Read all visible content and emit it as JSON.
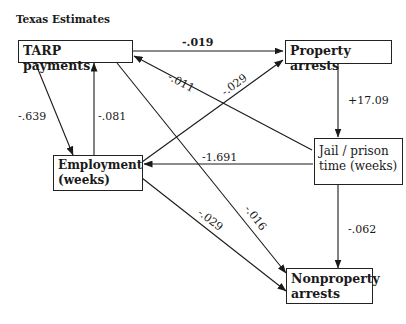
{
  "title": "Texas Estimates",
  "nodes": {
    "tarp": "TARP payments",
    "property": "Property arrests",
    "employment_l1": "Employment",
    "employment_l2": "(weeks)",
    "jail_l1": "Jail / prison",
    "jail_l2": "time (weeks)",
    "nonproperty_l1": "Nonproperty",
    "nonproperty_l2": "arrests"
  },
  "edges": [
    {
      "from": "TARP payments",
      "to": "Property arrests",
      "label": "-.019"
    },
    {
      "from": "TARP payments",
      "to": "Employment (weeks)",
      "label": "-.639"
    },
    {
      "from": "Employment (weeks)",
      "to": "TARP payments",
      "label": "-.081"
    },
    {
      "from": "Jail/prison time (weeks)",
      "to": "TARP payments",
      "label": "-.011"
    },
    {
      "from": "Employment (weeks)",
      "to": "Property arrests",
      "label": "-.029"
    },
    {
      "from": "Property arrests",
      "to": "Jail/prison time (weeks)",
      "label": "+17.09"
    },
    {
      "from": "Jail/prison time (weeks)",
      "to": "Employment (weeks)",
      "label": "-1.691"
    },
    {
      "from": "Employment (weeks)",
      "to": "Nonproperty arrests",
      "label": "-.029"
    },
    {
      "from": "TARP payments",
      "to": "Nonproperty arrests",
      "label": "-.016"
    },
    {
      "from": "Jail/prison time (weeks)",
      "to": "Nonproperty arrests",
      "label": "-.062"
    }
  ]
}
